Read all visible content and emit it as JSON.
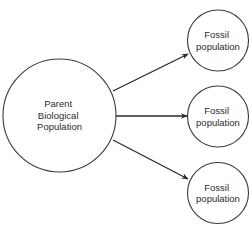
{
  "diagram": {
    "title": "",
    "colors": {
      "stroke": "#3a3a3a",
      "arrow": "#2a2a2a",
      "text": "#2b2b2b",
      "background": "#ffffff"
    },
    "nodes": [
      {
        "id": "parent",
        "shape": "circle",
        "lines": [
          "Parent",
          "Biological",
          "Population"
        ],
        "cx": 59.5,
        "cy": 115.5,
        "r": 56.5
      },
      {
        "id": "fossil_1",
        "shape": "circle",
        "lines": [
          "Fossil",
          "population"
        ],
        "cx": 218,
        "cy": 40.5,
        "r": 30.5
      },
      {
        "id": "fossil_2",
        "shape": "circle",
        "lines": [
          "Fossil",
          "population"
        ],
        "cx": 218,
        "cy": 116.5,
        "r": 30.5
      },
      {
        "id": "fossil_3",
        "shape": "circle",
        "lines": [
          "Fossil",
          "population"
        ],
        "cx": 218,
        "cy": 193,
        "r": 30.5
      }
    ],
    "edges": [
      {
        "from": "parent",
        "to": "fossil_1",
        "x1": 113,
        "y1": 91,
        "x2": 188,
        "y2": 54,
        "arrow": "end"
      },
      {
        "from": "parent",
        "to": "fossil_2",
        "x1": 116,
        "y1": 116,
        "x2": 187,
        "y2": 116,
        "arrow": "end"
      },
      {
        "from": "parent",
        "to": "fossil_3",
        "x1": 113,
        "y1": 140,
        "x2": 188,
        "y2": 179,
        "arrow": "end"
      }
    ]
  }
}
